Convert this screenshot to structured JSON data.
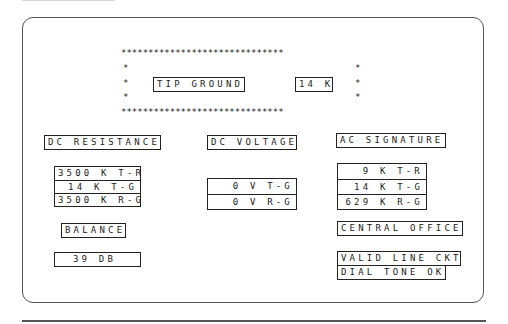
{
  "alert": {
    "stars_row": "******************************",
    "stars_col": "*",
    "label": "TIP GROUND",
    "value": "14 K"
  },
  "dc_resistance": {
    "title": "DC RESISTANCE",
    "rows": [
      "3500 K T-R",
      "14 K T-G",
      "3500 K R-G"
    ]
  },
  "dc_voltage": {
    "title": "DC VOLTAGE",
    "rows": [
      "0 V T-G",
      "0 V R-G"
    ]
  },
  "ac_signature": {
    "title": "AC SIGNATURE",
    "rows": [
      "9 K T-R",
      "14 K T-G",
      "629 K R-G"
    ]
  },
  "balance": {
    "title": "BALANCE",
    "value": "39 DB"
  },
  "central_office": {
    "title": "CENTRAL OFFICE",
    "status": [
      "VALID LINE CKT",
      "DIAL TONE OK"
    ]
  }
}
